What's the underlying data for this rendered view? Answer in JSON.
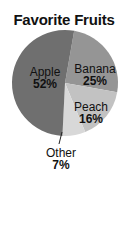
{
  "chart_data": {
    "type": "pie",
    "title": "Favorite Fruits",
    "categories": [
      "Apple",
      "Banana",
      "Peach",
      "Other"
    ],
    "values": [
      52,
      25,
      16,
      7
    ],
    "labels": [
      "52%",
      "25%",
      "16%",
      "7%"
    ],
    "colors": [
      "#6f6f6f",
      "#959595",
      "#c2c2c2",
      "#d8d8d8"
    ],
    "legend": "none (direct labels)",
    "annotations": [
      "Other slice labeled outside with leader line"
    ]
  },
  "labels": {
    "apple": {
      "name": "Apple",
      "pct": "52%"
    },
    "banana": {
      "name": "Banana",
      "pct": "25%"
    },
    "peach": {
      "name": "Peach",
      "pct": "16%"
    },
    "other": {
      "name": "Other",
      "pct": "7%"
    }
  }
}
